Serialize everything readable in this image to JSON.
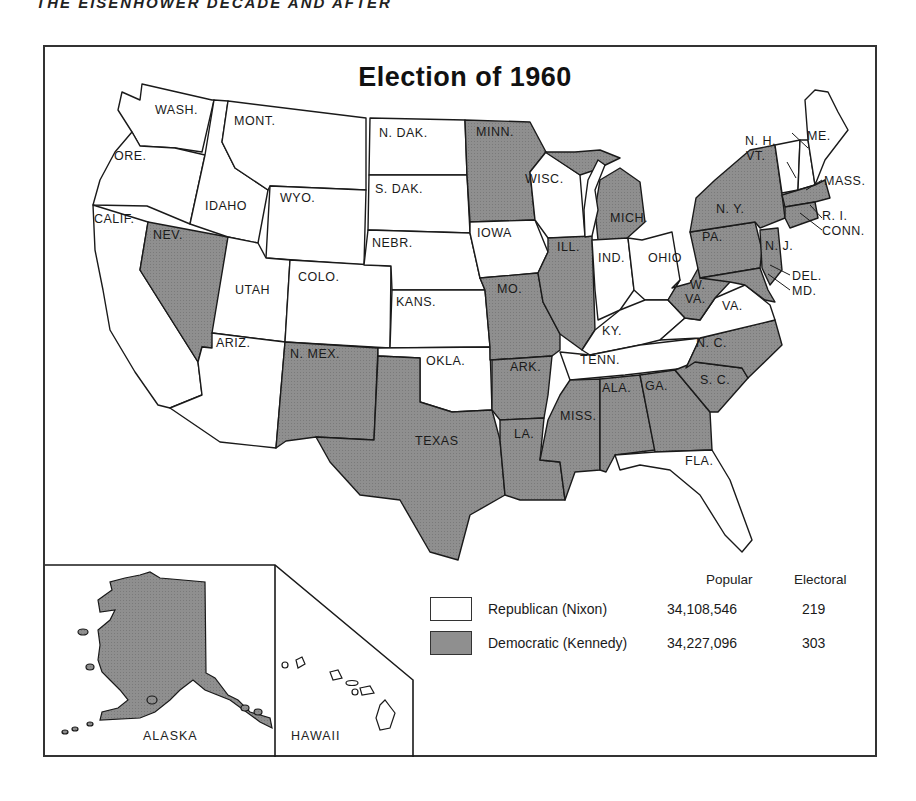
{
  "running_head": "THE EISENHOWER DECADE AND AFTER",
  "map": {
    "title": "Election of 1960",
    "colors": {
      "republican": "#ffffff",
      "democratic": "#8f8f8f",
      "outline": "#1a1a1a"
    },
    "state_labels": {
      "wash": "WASH.",
      "ore": "ORE.",
      "calif": "CALIF.",
      "nev": "NEV.",
      "idaho": "IDAHO",
      "mont": "MONT.",
      "wyo": "WYO.",
      "utah": "UTAH",
      "ariz": "ARIZ.",
      "colo": "COLO.",
      "nmex": "N. MEX.",
      "ndak": "N. DAK.",
      "sdak": "S. DAK.",
      "nebr": "NEBR.",
      "kans": "KANS.",
      "okla": "OKLA.",
      "texas": "TEXAS",
      "minn": "MINN.",
      "iowa": "IOWA",
      "mo": "MO.",
      "ark": "ARK.",
      "la": "LA.",
      "wisc": "WISC.",
      "ill": "ILL.",
      "mich": "MICH.",
      "ind": "IND.",
      "ohio": "OHIO",
      "ky": "KY.",
      "tenn": "TENN.",
      "miss": "MISS.",
      "ala": "ALA.",
      "ga": "GA.",
      "fla": "FLA.",
      "sc": "S. C.",
      "nc": "N. C.",
      "va": "VA.",
      "wva_w": "W.",
      "wva_va": "VA.",
      "pa": "PA.",
      "ny": "N. Y.",
      "nj": "N. J.",
      "del": "DEL.",
      "md": "MD.",
      "conn": "CONN.",
      "ri": "R. I.",
      "mass": "MASS.",
      "vt": "VT.",
      "nh": "N. H.",
      "me": "ME."
    },
    "insets": {
      "alaska": "ALASKA",
      "hawaii": "HAWAII"
    },
    "states": {
      "republican": [
        "WASH.",
        "ORE.",
        "CALIF.",
        "IDAHO",
        "MONT.",
        "WYO.",
        "UTAH",
        "ARIZ.",
        "COLO.",
        "N. DAK.",
        "S. DAK.",
        "NEBR.",
        "KANS.",
        "OKLA.",
        "IOWA",
        "WISC.",
        "IND.",
        "OHIO",
        "KY.",
        "TENN.",
        "VA.",
        "FLA.",
        "VT.",
        "N. H.",
        "ME.",
        "HAWAII"
      ],
      "democratic": [
        "NEV.",
        "N. MEX.",
        "TEXAS",
        "MINN.",
        "MO.",
        "ARK.",
        "LA.",
        "ILL.",
        "MICH.",
        "MISS.",
        "ALA.",
        "GA.",
        "S. C.",
        "N. C.",
        "W. VA.",
        "PA.",
        "N. Y.",
        "N. J.",
        "DEL.",
        "MD.",
        "CONN.",
        "R. I.",
        "MASS.",
        "ALASKA"
      ]
    }
  },
  "legend": {
    "headers": {
      "popular": "Popular",
      "electoral": "Electoral"
    },
    "rows": [
      {
        "party": "Republican (Nixon)",
        "popular": "34,108,546",
        "electoral": "219",
        "swatch": "republican"
      },
      {
        "party": "Democratic (Kennedy)",
        "popular": "34,227,096",
        "electoral": "303",
        "swatch": "democratic"
      }
    ]
  }
}
